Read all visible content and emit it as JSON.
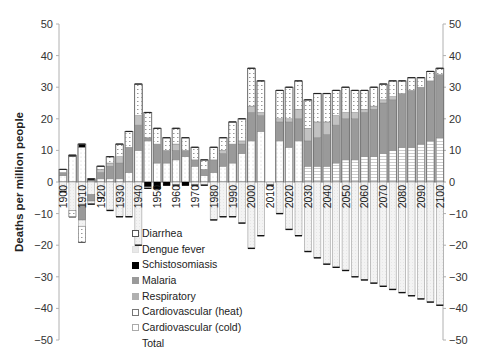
{
  "chart_data": {
    "type": "bar",
    "stacked": true,
    "title": "",
    "xlabel": "",
    "ylabel": "Deaths per million people",
    "ylim": [
      -50,
      50
    ],
    "yticks": [
      50,
      40,
      30,
      20,
      10,
      0,
      -10,
      -20,
      -30,
      -40,
      -50
    ],
    "grid": false,
    "secondary_y_axis": true,
    "x_tick_labels": [
      "1900",
      "1910",
      "1920",
      "1930",
      "1940",
      "1950",
      "1960",
      "1970",
      "1980",
      "1990",
      "2000",
      "2010",
      "2020",
      "2030",
      "2040",
      "2050",
      "2060",
      "2070",
      "2080",
      "2090",
      "2100"
    ],
    "x": [
      1900,
      1905,
      1910,
      1915,
      1920,
      1925,
      1930,
      1935,
      1940,
      1945,
      1950,
      1955,
      1960,
      1965,
      1970,
      1975,
      1980,
      1985,
      1990,
      1995,
      2000,
      2005,
      2010,
      2015,
      2020,
      2025,
      2030,
      2035,
      2040,
      2045,
      2050,
      2055,
      2060,
      2065,
      2070,
      2075,
      2080,
      2085,
      2090,
      2095,
      2100
    ],
    "legend": {
      "position": "lower-left-inside",
      "entries": [
        "Diarrhea",
        "Dengue fever",
        "Schistosomiasis",
        "Malaria",
        "Respiratory",
        "Cardiovascular (heat)",
        "Cardiovascular (cold)",
        "Total"
      ]
    },
    "series": [
      {
        "name": "Cardiovascular (heat)",
        "color": "#ffffff",
        "pattern": "dots",
        "values": [
          2,
          8,
          11,
          0.5,
          1,
          1,
          1,
          3,
          10,
          13,
          6,
          6,
          7,
          8,
          5,
          2,
          3,
          5,
          6,
          9,
          13,
          16,
          0,
          13,
          11,
          13,
          5,
          5,
          5,
          6,
          7,
          7,
          8,
          8,
          9,
          10,
          11,
          11,
          12,
          13,
          14
        ]
      },
      {
        "name": "Respiratory",
        "color": "#9a9a9a",
        "values": [
          1,
          0,
          0,
          0,
          2,
          4,
          5,
          8,
          8,
          1,
          6,
          4,
          3,
          2,
          2,
          2,
          4,
          4,
          6,
          3,
          9,
          5,
          0,
          6,
          8,
          7,
          8,
          9,
          10,
          12,
          13,
          13,
          14,
          15,
          16,
          16,
          17,
          18,
          18,
          19,
          20
        ]
      },
      {
        "name": "Malaria",
        "color": "#b5b5b5",
        "values": [
          0,
          0,
          0,
          0,
          1,
          1,
          2,
          0,
          3,
          0,
          0,
          0,
          2,
          0,
          0,
          0,
          0,
          1,
          0,
          1,
          2,
          1,
          0,
          1,
          1,
          3,
          4,
          5,
          4,
          3,
          2,
          2,
          1,
          1,
          1,
          1,
          0,
          0,
          0,
          0,
          0
        ]
      },
      {
        "name": "Schistosomiasis",
        "color": "#000000",
        "values": [
          0,
          0.5,
          1,
          0.5,
          0,
          0,
          0,
          0,
          0,
          0,
          0,
          0,
          0,
          0,
          0,
          0,
          0,
          0,
          0,
          0,
          0,
          0,
          0,
          0,
          0,
          0,
          0,
          0,
          0,
          0,
          0,
          0,
          0,
          0,
          0,
          0,
          0,
          0,
          0,
          0,
          0
        ]
      },
      {
        "name": "Diarrhea",
        "color": "#ffffff",
        "pattern": "dotted-box",
        "values": [
          1,
          0,
          0,
          0,
          1,
          2,
          4,
          5,
          10,
          8,
          5,
          4,
          5,
          4,
          4,
          3,
          4,
          4,
          7,
          7,
          12,
          10,
          0,
          9,
          10,
          9,
          9,
          9,
          9,
          8,
          8,
          7,
          6,
          6,
          5,
          5,
          4,
          4,
          3,
          3,
          2
        ]
      },
      {
        "name": "Cardiovascular (cold)",
        "color": "#f2f2f2",
        "values": [
          -3,
          -11,
          -19,
          -7,
          -5,
          -9,
          -11,
          -11,
          -20,
          -2,
          -2,
          -1,
          -1,
          -1,
          -1,
          -1,
          -12,
          -11,
          -11,
          -13,
          -21,
          -17,
          0,
          -10,
          -15,
          -17,
          -18,
          -20,
          -22,
          -23,
          -24,
          -25,
          -26,
          -27,
          -28,
          -29,
          -30,
          -31,
          -32,
          -33,
          -34
        ]
      }
    ],
    "totals_positive_approx": [
      4,
      8,
      12,
      1,
      5,
      8,
      10,
      15,
      33,
      22,
      18,
      12,
      19,
      14,
      11,
      7,
      15,
      14,
      19,
      21,
      36,
      33,
      0,
      29,
      30,
      32,
      30,
      30,
      30,
      30,
      30,
      30,
      30,
      30,
      31,
      31,
      32,
      33,
      34,
      35,
      36
    ],
    "totals_negative_approx": [
      -3,
      -11,
      -19,
      -7,
      -5,
      -9,
      -11,
      -11,
      -20,
      -2,
      -2,
      -1,
      -1,
      -1,
      -1,
      -1,
      -12,
      -11,
      -11,
      -13,
      -21,
      -17,
      -1,
      -10,
      -15,
      -17,
      -22,
      -24,
      -26,
      -27,
      -28,
      -30,
      -31,
      -32,
      -33,
      -34,
      -35,
      -36,
      -37,
      -38,
      -39
    ]
  },
  "axis": {
    "ylabel": "Deaths per million people",
    "left_ticks": [
      "50",
      "40",
      "30",
      "20",
      "10",
      "0",
      "−10",
      "−20",
      "−30",
      "−40",
      "−50"
    ],
    "right_ticks": [
      "50",
      "40",
      "30",
      "20",
      "10",
      "0",
      "−10",
      "−20",
      "−30",
      "−40",
      "−50"
    ]
  },
  "legend": {
    "items": [
      {
        "label": "Diarrhea",
        "swatch": "dotted-box"
      },
      {
        "label": "Dengue fever",
        "swatch": "light"
      },
      {
        "label": "Schistosomiasis",
        "swatch": "black"
      },
      {
        "label": "Malaria",
        "swatch": "gray"
      },
      {
        "label": "Respiratory",
        "swatch": "mid-gray"
      },
      {
        "label": "Cardiovascular (heat)",
        "swatch": "outline"
      },
      {
        "label": "Cardiovascular (cold)",
        "swatch": "outline-light"
      },
      {
        "label": "Total",
        "swatch": "none"
      }
    ]
  },
  "colors": {
    "axis": "#b0b0b0",
    "malaria": "#9a9a9a",
    "respiratory": "#b5b5b5",
    "schisto": "#000000",
    "bar_outline": "#707070"
  }
}
